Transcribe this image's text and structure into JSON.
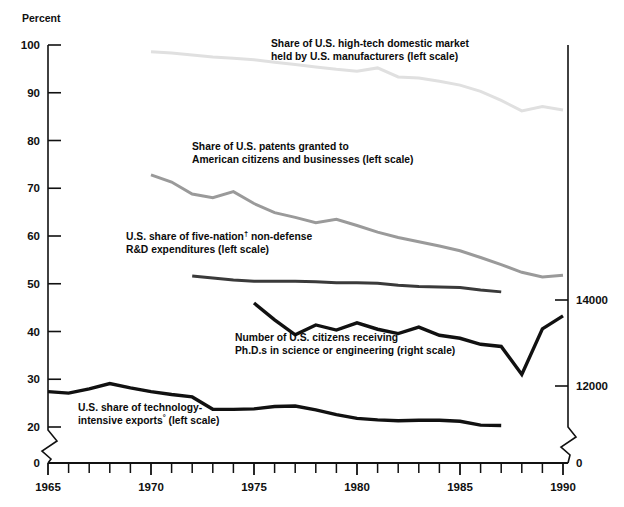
{
  "chart_data": {
    "type": "line",
    "title": "",
    "subtitle": "",
    "xlabel": "",
    "ylabel": "Percent",
    "ylabel_right": "",
    "xlim": [
      1964.2,
      1990.9
    ],
    "ylim": [
      0,
      100
    ],
    "ylim_right": [
      0,
      14000
    ],
    "grid": false,
    "legend": "inline-annotations",
    "x_ticks_major": [
      "1965",
      "1970",
      "1975",
      "1980",
      "1985",
      "1990"
    ],
    "x_tick_values_major": [
      1965,
      1970,
      1975,
      1980,
      1985,
      1990
    ],
    "x_ticks_minor_every": 1,
    "y_ticks_left": [
      "0",
      "20",
      "30",
      "40",
      "50",
      "60",
      "70",
      "80",
      "90",
      "100"
    ],
    "y_tick_values_left": [
      0,
      20,
      30,
      40,
      50,
      60,
      70,
      80,
      90,
      100
    ],
    "y_axis_break_left": true,
    "y_ticks_right": [
      "0",
      "12000",
      "14000"
    ],
    "y_tick_values_right": [
      0,
      12000,
      14000
    ],
    "y_axis_break_right": true,
    "series": [
      {
        "name": "Share of U.S. high-tech domestic market held by U.S. manufacturers",
        "scale": "left",
        "color": "#e0e0e0",
        "width": 3.0,
        "x": [
          1970,
          1971,
          1972,
          1973,
          1974,
          1975,
          1976,
          1977,
          1978,
          1979,
          1980,
          1981,
          1982,
          1983,
          1984,
          1985,
          1986,
          1987,
          1988,
          1989,
          1990
        ],
        "values": [
          98.6,
          98.3,
          97.9,
          97.5,
          97.2,
          96.9,
          96.4,
          95.9,
          95.4,
          94.9,
          94.5,
          95.2,
          93.3,
          93.1,
          92.4,
          91.6,
          90.3,
          88.4,
          86.2,
          87.1,
          86.4
        ]
      },
      {
        "name": "Share of U.S. patents granted to American citizens and businesses",
        "scale": "left",
        "color": "#9a9a9a",
        "width": 3.0,
        "x": [
          1970,
          1971,
          1972,
          1973,
          1974,
          1975,
          1976,
          1977,
          1978,
          1979,
          1980,
          1981,
          1982,
          1983,
          1984,
          1985,
          1986,
          1987,
          1988,
          1989,
          1990
        ],
        "values": [
          72.8,
          71.3,
          68.8,
          68.0,
          69.3,
          66.8,
          64.9,
          63.9,
          62.8,
          63.5,
          62.2,
          60.8,
          59.7,
          58.8,
          57.9,
          56.9,
          55.5,
          54.0,
          52.4,
          51.4,
          51.8
        ]
      },
      {
        "name": "U.S. share of five-nation non-defense R&D expenditures",
        "scale": "left",
        "color": "#3a3a3a",
        "width": 3.0,
        "x": [
          1972,
          1973,
          1974,
          1975,
          1976,
          1977,
          1978,
          1979,
          1980,
          1981,
          1982,
          1983,
          1984,
          1985,
          1986,
          1987
        ],
        "values": [
          51.6,
          51.2,
          50.8,
          50.5,
          50.5,
          50.5,
          50.4,
          50.2,
          50.2,
          50.1,
          49.7,
          49.4,
          49.3,
          49.2,
          48.7,
          48.3
        ]
      },
      {
        "name": "Number of U.S. citizens receiving Ph.D.s in science or engineering",
        "scale": "right",
        "color": "#111111",
        "width": 3.4,
        "x": [
          1975,
          1976,
          1977,
          1978,
          1979,
          1980,
          1981,
          1982,
          1983,
          1984,
          1985,
          1986,
          1987,
          1988,
          1989,
          1990
        ],
        "values": [
          13930,
          13540,
          13190,
          13420,
          13300,
          13470,
          13320,
          13220,
          13370,
          13180,
          13110,
          12970,
          12920,
          12270,
          13330,
          13630
        ]
      },
      {
        "name": "U.S. share of technology-intensive exports",
        "scale": "left",
        "color": "#111111",
        "width": 3.4,
        "x": [
          1965,
          1966,
          1967,
          1968,
          1969,
          1970,
          1971,
          1972,
          1973,
          1974,
          1975,
          1976,
          1977,
          1978,
          1979,
          1980,
          1981,
          1982,
          1983,
          1984,
          1985,
          1986,
          1987
        ],
        "values": [
          27.4,
          27.1,
          28.0,
          29.1,
          28.2,
          27.4,
          26.8,
          26.3,
          23.7,
          23.7,
          23.8,
          24.3,
          24.4,
          23.6,
          22.6,
          21.8,
          21.5,
          21.3,
          21.4,
          21.4,
          21.2,
          20.4,
          20.3
        ]
      }
    ],
    "annotations": [
      {
        "id": "annot-hightech",
        "lines": [
          "Share of U.S. high-tech domestic market",
          "held by U.S. manufacturers (left scale)"
        ],
        "x": 271,
        "y": 47
      },
      {
        "id": "annot-patents",
        "lines": [
          "Share of U.S. patents granted to",
          "American citizens and businesses (left scale)"
        ],
        "x": 192,
        "y": 150
      },
      {
        "id": "annot-rd",
        "lines": [
          "U.S. share of five-nation† non-defense",
          "R&D expenditures (left scale)"
        ],
        "x": 126,
        "y": 240
      },
      {
        "id": "annot-phd",
        "lines": [
          "Number of U.S. citizens receiving",
          "Ph.D.s in science or engineering (right scale)"
        ],
        "x": 235,
        "y": 341
      },
      {
        "id": "annot-exports",
        "lines": [
          "U.S. share of technology-",
          "intensive exports° (left scale)"
        ],
        "x": 78,
        "y": 411
      }
    ]
  },
  "axes": {
    "percent_label": "Percent"
  }
}
